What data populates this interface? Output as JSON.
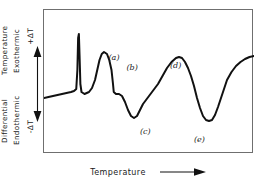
{
  "figure": {
    "type": "differential-thermal-analysis-curve",
    "axes": {
      "y": {
        "outer_label_top": "Temperature",
        "outer_label_bottom": "Differential",
        "inner_label_top": "Exothermic",
        "inner_label_bottom": "Endothermic",
        "positive_tick": "+ΔT",
        "negative_tick": "-ΔT",
        "arrow_icon": "double-headed-vertical-arrow"
      },
      "x": {
        "label": "Temperature",
        "arrow_icon": "right-arrow"
      }
    },
    "annotations": [
      {
        "id": "a",
        "label": "(a)",
        "kind": "exothermic-spike",
        "x": 86,
        "y": 44
      },
      {
        "id": "b",
        "label": "(b)",
        "kind": "exothermic-peak",
        "x": 110,
        "y": 54
      },
      {
        "id": "c",
        "label": "(c)",
        "kind": "endothermic-dip",
        "x": 128,
        "y": 118
      },
      {
        "id": "d",
        "label": "(d)",
        "kind": "exothermic-peak",
        "x": 168,
        "y": 52
      },
      {
        "id": "e",
        "label": "(e)",
        "kind": "endothermic-dip",
        "x": 200,
        "y": 126
      }
    ],
    "colors": {
      "curve": "#111111",
      "frame": "#6f6f6f",
      "text": "#1a1a1a",
      "background": "#ffffff"
    }
  },
  "chart_data": {
    "type": "line",
    "title": "",
    "xlabel": "Temperature",
    "ylabel": "Differential Temperature",
    "grid": false,
    "legend": null,
    "axis_notes": {
      "y_positive_direction": "Exothermic (+ΔT)",
      "y_negative_direction": "Endothermic (-ΔT)",
      "x_direction": "increasing Temperature"
    },
    "series": [
      {
        "name": "DTA trace",
        "comment": "y in plot-box pixel coords, 0 = top of 144px box; baseline ≈ 86",
        "points": [
          [
            0,
            88
          ],
          [
            6,
            87
          ],
          [
            12,
            86
          ],
          [
            18,
            85
          ],
          [
            24,
            84
          ],
          [
            30,
            83
          ],
          [
            36,
            82
          ],
          [
            40,
            81
          ],
          [
            43,
            79
          ],
          [
            44.5,
            60
          ],
          [
            45.5,
            28
          ],
          [
            46.5,
            24
          ],
          [
            47.5,
            48
          ],
          [
            48.5,
            74
          ],
          [
            50,
            82
          ],
          [
            54,
            84
          ],
          [
            60,
            82
          ],
          [
            64,
            78
          ],
          [
            68,
            70
          ],
          [
            71,
            60
          ],
          [
            74,
            50
          ],
          [
            77,
            44
          ],
          [
            80,
            42
          ],
          [
            84,
            44
          ],
          [
            87,
            50
          ],
          [
            90,
            60
          ],
          [
            92,
            74
          ],
          [
            93,
            82
          ],
          [
            96,
            84
          ],
          [
            100,
            84
          ],
          [
            104,
            86
          ],
          [
            108,
            92
          ],
          [
            112,
            100
          ],
          [
            116,
            106
          ],
          [
            120,
            108
          ],
          [
            124,
            106
          ],
          [
            128,
            100
          ],
          [
            132,
            94
          ],
          [
            136,
            90
          ],
          [
            140,
            86
          ],
          [
            146,
            80
          ],
          [
            152,
            74
          ],
          [
            158,
            66
          ],
          [
            164,
            58
          ],
          [
            170,
            52
          ],
          [
            176,
            48
          ],
          [
            180,
            47
          ],
          [
            184,
            48
          ],
          [
            188,
            52
          ],
          [
            192,
            58
          ],
          [
            196,
            66
          ],
          [
            200,
            76
          ],
          [
            204,
            88
          ],
          [
            208,
            98
          ],
          [
            212,
            106
          ],
          [
            216,
            110
          ],
          [
            220,
            111
          ],
          [
            224,
            110
          ],
          [
            228,
            105
          ],
          [
            232,
            97
          ],
          [
            236,
            88
          ],
          [
            240,
            79
          ],
          [
            244,
            70
          ],
          [
            250,
            62
          ],
          [
            256,
            56
          ],
          [
            262,
            52
          ],
          [
            268,
            49
          ],
          [
            274,
            47
          ],
          [
            280,
            46
          ]
        ]
      }
    ]
  }
}
